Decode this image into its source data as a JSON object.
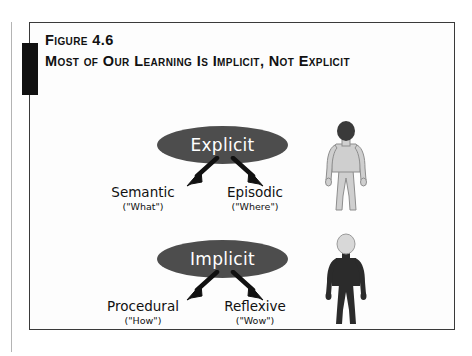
{
  "figure": {
    "number_label": "Figure 4.6",
    "title": "Most of Our Learning Is Implicit, Not Explicit"
  },
  "colors": {
    "ellipse_fill": "#4d4d4d",
    "ellipse_text": "#ffffff",
    "frame_border": "#3a3a3a",
    "tab_fill": "#111111",
    "background": "#fdfdfd",
    "light_body": "#cfcfcf",
    "dark_body": "#2b2b2b"
  },
  "diagram": {
    "groups": [
      {
        "id": "explicit",
        "node_label": "Explicit",
        "figure_style": "light-body-dark-head",
        "branches": [
          {
            "main": "Semantic",
            "sub": "(\"What\")"
          },
          {
            "main": "Episodic",
            "sub": "(\"Where\")"
          }
        ]
      },
      {
        "id": "implicit",
        "node_label": "Implicit",
        "figure_style": "dark-body-light-head",
        "branches": [
          {
            "main": "Procedural",
            "sub": "(\"How\")"
          },
          {
            "main": "Reflexive",
            "sub": "(\"Wow\")"
          }
        ]
      }
    ]
  }
}
